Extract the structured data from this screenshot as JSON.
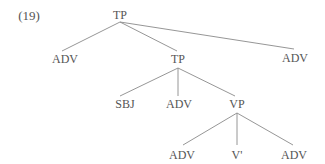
{
  "example_number": "(19)",
  "tree": {
    "nodes": [
      {
        "id": "tp_root",
        "label": "TP",
        "x": 120,
        "y": 15
      },
      {
        "id": "adv_left",
        "label": "ADV",
        "x": 65,
        "y": 59
      },
      {
        "id": "tp_mid",
        "label": "TP",
        "x": 178,
        "y": 59
      },
      {
        "id": "adv_right",
        "label": "ADV",
        "x": 295,
        "y": 58
      },
      {
        "id": "sbj",
        "label": "SBJ",
        "x": 125,
        "y": 104
      },
      {
        "id": "adv_mid",
        "label": "ADV",
        "x": 179,
        "y": 104
      },
      {
        "id": "vp",
        "label": "VP",
        "x": 237,
        "y": 104
      },
      {
        "id": "adv_vp_left",
        "label": "ADV",
        "x": 182,
        "y": 155
      },
      {
        "id": "v_bar",
        "label": "V'",
        "x": 237,
        "y": 155
      },
      {
        "id": "adv_vp_right",
        "label": "ADV",
        "x": 294,
        "y": 155
      }
    ],
    "edges": [
      [
        "tp_root",
        "adv_left"
      ],
      [
        "tp_root",
        "tp_mid"
      ],
      [
        "tp_root",
        "adv_right"
      ],
      [
        "tp_mid",
        "sbj"
      ],
      [
        "tp_mid",
        "adv_mid"
      ],
      [
        "tp_mid",
        "vp"
      ],
      [
        "vp",
        "adv_vp_left"
      ],
      [
        "vp",
        "v_bar"
      ],
      [
        "vp",
        "adv_vp_right"
      ]
    ]
  },
  "colors": {
    "text": "#555555",
    "line": "#8a8a8a",
    "background": "#ffffff"
  }
}
